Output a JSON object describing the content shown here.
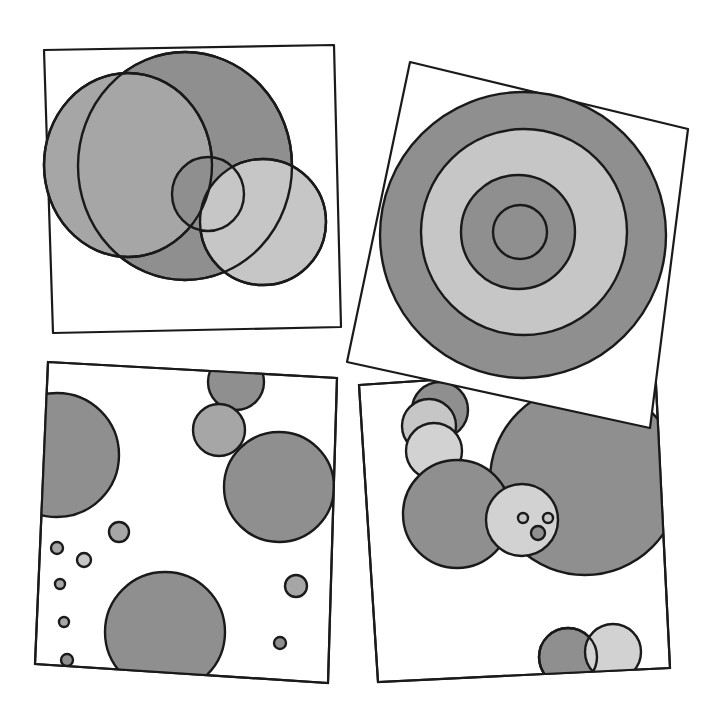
{
  "artwork": {
    "description": "Four hand-drawn square panels containing gray circles",
    "colors": {
      "outline": "#1a1a1a",
      "dark_gray": "#8f8f8f",
      "mid_gray": "#a6a6a6",
      "light_gray": "#c6c6c6",
      "pale_gray": "#d2d2d2",
      "paper": "#ffffff"
    },
    "panels": [
      {
        "id": "top-left",
        "theme": "overlapping circles"
      },
      {
        "id": "top-right",
        "theme": "concentric rings (target)",
        "rotation_deg": 12
      },
      {
        "id": "bottom-left",
        "theme": "scattered circles of varying sizes"
      },
      {
        "id": "bottom-right",
        "theme": "clustered circles with a face-like circle"
      }
    ]
  }
}
